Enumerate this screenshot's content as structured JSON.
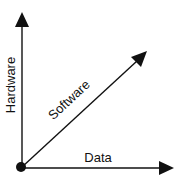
{
  "diagram": {
    "title": "",
    "axes": [
      {
        "id": "hardware",
        "label": "Hardware",
        "direction": "vertical"
      },
      {
        "id": "software",
        "label": "Software",
        "direction": "diagonal"
      },
      {
        "id": "data",
        "label": "Data",
        "direction": "horizontal"
      }
    ],
    "origin": {
      "shape": "filled-circle"
    },
    "colors": {
      "stroke": "#111111",
      "background": "#ffffff"
    }
  }
}
